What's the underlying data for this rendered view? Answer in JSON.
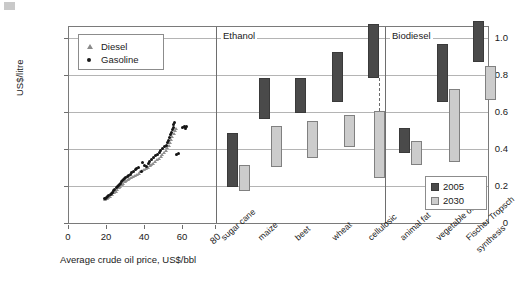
{
  "chart_data": {
    "type": "bar",
    "title": "",
    "ylabel": "US$/litre",
    "ylim": [
      0,
      1.12
    ],
    "yticks": [
      "0",
      "0.2",
      "0.4",
      "0.6",
      "0.8",
      "1.0"
    ],
    "grid": true,
    "legend_position": "bottom-right",
    "panels": [
      {
        "name": "crude-oil-scatter",
        "type": "scatter",
        "xlabel": "Average crude oil price, US$/bbl",
        "xticks": [
          "0",
          "20",
          "40",
          "60",
          "80"
        ],
        "xlim": [
          0,
          88
        ],
        "series": [
          {
            "name": "Diesel",
            "marker": "triangle",
            "color": "#8f8f8f"
          },
          {
            "name": "Gasoline",
            "marker": "circle",
            "color": "#141414"
          }
        ],
        "points_gasoline": [
          [
            19.2,
            0.148
          ],
          [
            19.8,
            0.152
          ],
          [
            20.4,
            0.158
          ],
          [
            21.0,
            0.16
          ],
          [
            21.6,
            0.166
          ],
          [
            22.4,
            0.172
          ],
          [
            23.0,
            0.18
          ],
          [
            23.8,
            0.186
          ],
          [
            24.4,
            0.196
          ],
          [
            25.0,
            0.2
          ],
          [
            25.6,
            0.21
          ],
          [
            26.2,
            0.216
          ],
          [
            26.8,
            0.222
          ],
          [
            27.4,
            0.23
          ],
          [
            28.0,
            0.236
          ],
          [
            28.6,
            0.244
          ],
          [
            29.2,
            0.25
          ],
          [
            29.8,
            0.258
          ],
          [
            30.4,
            0.262
          ],
          [
            31.0,
            0.268
          ],
          [
            31.8,
            0.274
          ],
          [
            32.6,
            0.282
          ],
          [
            33.4,
            0.288
          ],
          [
            34.2,
            0.296
          ],
          [
            35.0,
            0.3
          ],
          [
            36.0,
            0.312
          ],
          [
            37.0,
            0.32
          ],
          [
            38.0,
            0.326
          ],
          [
            39.2,
            0.3
          ],
          [
            40.0,
            0.352
          ],
          [
            41.0,
            0.338
          ],
          [
            42.0,
            0.33
          ],
          [
            43.0,
            0.348
          ],
          [
            44.0,
            0.362
          ],
          [
            45.0,
            0.372
          ],
          [
            46.0,
            0.38
          ],
          [
            47.0,
            0.392
          ],
          [
            48.0,
            0.4
          ],
          [
            49.0,
            0.412
          ],
          [
            50.0,
            0.42
          ],
          [
            51.0,
            0.432
          ],
          [
            52.0,
            0.442
          ],
          [
            52.8,
            0.452
          ],
          [
            53.4,
            0.466
          ],
          [
            54.0,
            0.48
          ],
          [
            54.6,
            0.496
          ],
          [
            55.2,
            0.51
          ],
          [
            55.8,
            0.524
          ],
          [
            56.2,
            0.54
          ],
          [
            56.6,
            0.552
          ],
          [
            57.0,
            0.566
          ],
          [
            57.6,
            0.578
          ],
          [
            58.4,
            0.4
          ],
          [
            59.4,
            0.402
          ],
          [
            62.0,
            0.552
          ],
          [
            62.8,
            0.56
          ],
          [
            63.4,
            0.548
          ],
          [
            64.0,
            0.556
          ]
        ],
        "points_diesel": [
          [
            19.4,
            0.146
          ],
          [
            20.2,
            0.15
          ],
          [
            21.2,
            0.156
          ],
          [
            22.2,
            0.164
          ],
          [
            23.2,
            0.172
          ],
          [
            24.2,
            0.182
          ],
          [
            25.2,
            0.192
          ],
          [
            26.0,
            0.202
          ],
          [
            26.8,
            0.212
          ],
          [
            27.6,
            0.22
          ],
          [
            28.4,
            0.228
          ],
          [
            29.2,
            0.236
          ],
          [
            30.0,
            0.244
          ],
          [
            30.8,
            0.25
          ],
          [
            31.6,
            0.256
          ],
          [
            32.6,
            0.262
          ],
          [
            33.6,
            0.268
          ],
          [
            34.6,
            0.276
          ],
          [
            35.6,
            0.282
          ],
          [
            36.6,
            0.288
          ],
          [
            37.6,
            0.294
          ],
          [
            38.6,
            0.3
          ],
          [
            39.6,
            0.306
          ],
          [
            40.6,
            0.312
          ],
          [
            41.6,
            0.318
          ],
          [
            42.6,
            0.326
          ],
          [
            43.6,
            0.334
          ],
          [
            44.6,
            0.342
          ],
          [
            45.6,
            0.35
          ],
          [
            46.6,
            0.36
          ],
          [
            47.6,
            0.368
          ],
          [
            48.6,
            0.376
          ],
          [
            49.6,
            0.386
          ],
          [
            50.6,
            0.396
          ],
          [
            51.6,
            0.408
          ],
          [
            52.4,
            0.424
          ],
          [
            53.2,
            0.438
          ],
          [
            54.0,
            0.452
          ],
          [
            54.8,
            0.468
          ],
          [
            55.4,
            0.486
          ],
          [
            56.0,
            0.502
          ],
          [
            56.6,
            0.518
          ],
          [
            57.2,
            0.534
          ],
          [
            58.0,
            0.548
          ],
          [
            62.2,
            0.556
          ]
        ]
      },
      {
        "name": "biofuel-cost-ranges",
        "type": "range-bar",
        "sections": [
          {
            "label": "Ethanol",
            "categories": [
              "sugar cane",
              "maize",
              "beet",
              "wheat",
              "cellulosic"
            ]
          },
          {
            "label": "Biodiesel",
            "categories": [
              "animal fat",
              "vegetable oil",
              "Fischer Tropsch synthesis"
            ]
          }
        ],
        "categories": [
          "sugar cane",
          "maize",
          "beet",
          "wheat",
          "cellulosic",
          "animal fat",
          "vegetable oil",
          "Fischer Tropsch synthesis"
        ],
        "series": [
          {
            "name": "2005",
            "color": "#4a4a4a",
            "ranges": [
              {
                "category": "sugar cane",
                "low": 0.2,
                "high": 0.49
              },
              {
                "category": "maize",
                "low": 0.57,
                "high": 0.79
              },
              {
                "category": "beet",
                "low": 0.6,
                "high": 0.79
              },
              {
                "category": "wheat",
                "low": 0.66,
                "high": 0.93
              },
              {
                "category": "cellulosic",
                "low": 0.79,
                "high": 1.07
              },
              {
                "category": "animal fat",
                "low": 0.39,
                "high": 0.52
              },
              {
                "category": "vegetable oil",
                "low": 0.66,
                "high": 0.97
              },
              {
                "category": "Fischer Tropsch synthesis",
                "low": 0.87,
                "high": 1.09
              }
            ]
          },
          {
            "name": "2030",
            "color": "#cccccc",
            "ranges": [
              {
                "category": "sugar cane",
                "low": 0.18,
                "high": 0.32
              },
              {
                "category": "maize",
                "low": 0.31,
                "high": 0.53
              },
              {
                "category": "beet",
                "low": 0.36,
                "high": 0.56
              },
              {
                "category": "wheat",
                "low": 0.41,
                "high": 0.58
              },
              {
                "category": "cellulosic",
                "low": 0.25,
                "high": 0.61
              },
              {
                "category": "animal fat",
                "low": 0.32,
                "high": 0.45
              },
              {
                "category": "vegetable oil",
                "low": 0.33,
                "high": 0.72
              },
              {
                "category": "Fischer Tropsch synthesis",
                "low": 0.67,
                "high": 0.85
              }
            ]
          }
        ],
        "legend": [
          "2005",
          "2030"
        ]
      }
    ]
  },
  "axis": {
    "ylabel": "US$/litre",
    "yticks": [
      "1.0",
      "0.8",
      "0.6",
      "0.4",
      "0.2",
      "0"
    ],
    "xlabel": "Average crude oil price, US$/bbl",
    "xticks": [
      "0",
      "20",
      "40",
      "60",
      "80"
    ]
  },
  "sections": {
    "ethanol": "Ethanol",
    "biodiesel": "Biodiesel"
  },
  "scatter_legend": {
    "diesel": "Diesel",
    "gasoline": "Gasoline"
  },
  "bar_legend": {
    "y2005": "2005",
    "y2030": "2030"
  },
  "categories": [
    "sugar cane",
    "maize",
    "beet",
    "wheat",
    "cellulosic",
    "animal fat",
    "vegetable oil",
    "Fischer Tropsch",
    "synthesis"
  ]
}
